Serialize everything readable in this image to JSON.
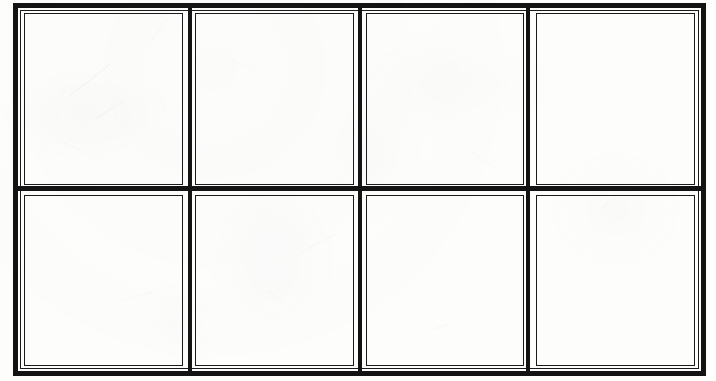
{
  "document": {
    "kind": "blank-storyboard-panel-grid",
    "medium": "scanned paper",
    "title": "",
    "caption": "",
    "page_number": "",
    "background_color": "#fdfdfc",
    "ink_color": "#131313",
    "panel_border_color": "#1b1b1b"
  },
  "frame": {
    "outer_border_width_px": 5,
    "inner_hairline_width_px": 1.5,
    "x": 13,
    "y": 3,
    "width": 693,
    "height": 373
  },
  "grid": {
    "columns": 4,
    "rows": 2,
    "total_panels": 8,
    "divider_style": "double-line",
    "vertical_divider_x": [
      190,
      360,
      528
    ],
    "horizontal_divider_y": [
      188
    ]
  },
  "panels": [
    {
      "id": "panel-1",
      "row": 1,
      "column": 1,
      "label": "",
      "content": "",
      "state": "empty"
    },
    {
      "id": "panel-2",
      "row": 1,
      "column": 2,
      "label": "",
      "content": "",
      "state": "empty"
    },
    {
      "id": "panel-3",
      "row": 1,
      "column": 3,
      "label": "",
      "content": "",
      "state": "empty"
    },
    {
      "id": "panel-4",
      "row": 1,
      "column": 4,
      "label": "",
      "content": "",
      "state": "empty"
    },
    {
      "id": "panel-5",
      "row": 2,
      "column": 1,
      "label": "",
      "content": "",
      "state": "empty"
    },
    {
      "id": "panel-6",
      "row": 2,
      "column": 2,
      "label": "",
      "content": "",
      "state": "empty"
    },
    {
      "id": "panel-7",
      "row": 2,
      "column": 3,
      "label": "",
      "content": "",
      "state": "empty"
    },
    {
      "id": "panel-8",
      "row": 2,
      "column": 4,
      "label": "",
      "content": "",
      "state": "empty"
    }
  ],
  "smudges": [
    {
      "left": 70,
      "top": 95,
      "width": 52,
      "height": 1,
      "rotate": -38,
      "opacity": 0.5
    },
    {
      "left": 96,
      "top": 118,
      "width": 34,
      "height": 1,
      "rotate": -32,
      "opacity": 0.42
    },
    {
      "left": 58,
      "top": 140,
      "width": 26,
      "height": 1,
      "rotate": 22,
      "opacity": 0.35
    },
    {
      "left": 150,
      "top": 42,
      "width": 30,
      "height": 1,
      "rotate": -55,
      "opacity": 0.3
    },
    {
      "left": 232,
      "top": 60,
      "width": 24,
      "height": 1,
      "rotate": 18,
      "opacity": 0.28
    },
    {
      "left": 300,
      "top": 252,
      "width": 40,
      "height": 1,
      "rotate": -28,
      "opacity": 0.32
    },
    {
      "left": 268,
      "top": 290,
      "width": 28,
      "height": 1,
      "rotate": 40,
      "opacity": 0.26
    },
    {
      "left": 430,
      "top": 330,
      "width": 22,
      "height": 1,
      "rotate": -20,
      "opacity": 0.3
    },
    {
      "left": 470,
      "top": 150,
      "width": 30,
      "height": 1,
      "rotate": 35,
      "opacity": 0.24
    },
    {
      "left": 600,
      "top": 210,
      "width": 26,
      "height": 1,
      "rotate": -42,
      "opacity": 0.28
    },
    {
      "left": 560,
      "top": 90,
      "width": 20,
      "height": 1,
      "rotate": 12,
      "opacity": 0.22
    },
    {
      "left": 120,
      "top": 300,
      "width": 34,
      "height": 1,
      "rotate": -15,
      "opacity": 0.25
    }
  ]
}
